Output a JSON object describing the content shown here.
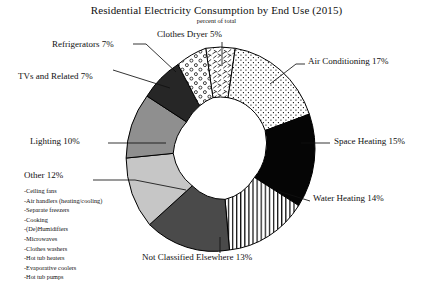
{
  "chart_data": {
    "type": "pie",
    "title": "Residential Electricity Consumption by End Use (2015)",
    "subtitle": "percent of total",
    "unit": "percent of total",
    "donut": true,
    "legend": "labels-with-leader-lines",
    "categories": [
      "Clothes Dryer",
      "Air Conditioning",
      "Space Heating",
      "Water Heating",
      "Not Classified Elsewhere",
      "Other",
      "Lighting",
      "TVs and Related",
      "Refrigerators"
    ],
    "values": [
      5,
      17,
      15,
      14,
      13,
      12,
      10,
      7,
      7
    ],
    "slices": [
      {
        "label": "Clothes Dryer",
        "value": 5,
        "label_text": "Clothes Dryer 5%",
        "fill": "squiggle",
        "color": "#ffffff"
      },
      {
        "label": "Air Conditioning",
        "value": 17,
        "label_text": "Air Conditioning 17%",
        "fill": "fine-dots",
        "color": "#ffffff"
      },
      {
        "label": "Space Heating",
        "value": 15,
        "label_text": "Space Heating 15%",
        "fill": "solid",
        "color": "#050505"
      },
      {
        "label": "Water Heating",
        "value": 14,
        "label_text": "Water Heating 14%",
        "fill": "horizontal-lines",
        "color": "#ffffff"
      },
      {
        "label": "Not Classified Elsewhere",
        "value": 13,
        "label_text": "Not Classified Elsewhere 13%",
        "fill": "solid",
        "color": "#4a4a4a"
      },
      {
        "label": "Other",
        "value": 12,
        "label_text": "Other 12%",
        "fill": "solid",
        "color": "#c6c6c6"
      },
      {
        "label": "Lighting",
        "value": 10,
        "label_text": "Lighting 10%",
        "fill": "solid",
        "color": "#8f8f8f"
      },
      {
        "label": "TVs and Related",
        "value": 7,
        "label_text": "TVs and Related 7%",
        "fill": "solid",
        "color": "#262626"
      },
      {
        "label": "Refrigerators",
        "value": 7,
        "label_text": "Refrigerators 7%",
        "fill": "open-circles",
        "color": "#ffffff"
      }
    ]
  },
  "labels": {
    "clothes_dryer": "Clothes Dryer 5%",
    "air_conditioning": "Air Conditioning 17%",
    "space_heating": "Space Heating 15%",
    "water_heating": "Water Heating 14%",
    "not_classified": "Not Classified Elsewhere 13%",
    "other": "Other 12%",
    "lighting": "Lighting 10%",
    "tvs": "TVs and Related 7%",
    "refrigerators": "Refrigerators 7%"
  },
  "other_breakdown": [
    "-Ceiling fans",
    "-Air handlers (heating/cooling)",
    "-Separate freezers",
    "-Cooking",
    "-(De)Humidifiers",
    "-Microwaves",
    "-Clothes washers",
    "-Hot tub heaters",
    "-Evaporative coolers",
    "-Hot tub pumps"
  ],
  "colors": {
    "stroke": "#000000",
    "background": "#ffffff",
    "text": "#101010"
  }
}
